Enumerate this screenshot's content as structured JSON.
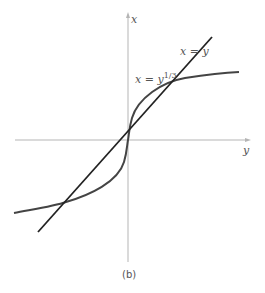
{
  "figure": {
    "caption": "(b)",
    "axes": {
      "vertical_label": "x",
      "horizontal_label": "y"
    },
    "curves": [
      {
        "label_base": "x = y",
        "label_exp": "1/3",
        "name": "cube root curve"
      },
      {
        "label": "x = y",
        "name": "identity line"
      }
    ],
    "colors": {
      "axis": "#b0b0b0",
      "curve": "#444444",
      "line": "#222222"
    }
  }
}
